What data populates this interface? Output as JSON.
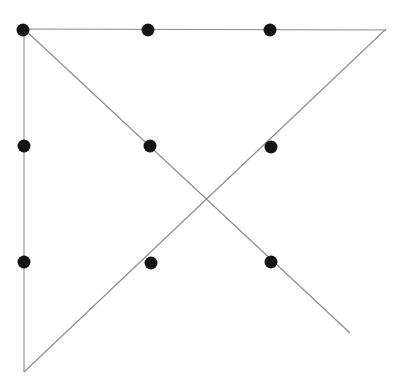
{
  "figure": {
    "canvas": {
      "width": 401,
      "height": 388,
      "background_color": "#ffffff"
    },
    "style": {
      "line_color": "#8a8a8a",
      "line_width": 1.1,
      "dot_color": "#141414",
      "dot_radius": 6.5
    },
    "lines": [
      {
        "name": "left-vertical-edge",
        "label": "Left vertical edge",
        "x1": 24.0,
        "y1": 29.0,
        "x2": 24.0,
        "y2": 372.0
      },
      {
        "name": "top-horizontal-edge",
        "label": "Top horizontal edge",
        "x1": 24.0,
        "y1": 29.0,
        "x2": 386.0,
        "y2": 30.0
      },
      {
        "name": "descending-diagonal",
        "label": "Diagonal from top-left to lower-right",
        "x1": 24.0,
        "y1": 29.0,
        "x2": 350.0,
        "y2": 333.0
      },
      {
        "name": "ascending-diagonal",
        "label": "Diagonal from bottom-left to top-right",
        "x1": 24.0,
        "y1": 372.0,
        "x2": 386.0,
        "y2": 29.0
      }
    ],
    "intersection": {
      "name": "diagonal-crossing-point",
      "label": "Crossing point of the two diagonals",
      "x": 200.0,
      "y": 198.0
    },
    "dots": [
      {
        "name": "dot-top-left",
        "label": "Top-left corner point",
        "x": 23.0,
        "y": 30.0,
        "row": 1,
        "col": 1
      },
      {
        "name": "dot-top-center",
        "label": "Top edge midpoint",
        "x": 148.0,
        "y": 30.0,
        "row": 1,
        "col": 2
      },
      {
        "name": "dot-top-right",
        "label": "Top edge right point",
        "x": 270.0,
        "y": 30.0,
        "row": 1,
        "col": 3
      },
      {
        "name": "dot-middle-left",
        "label": "Left edge middle point",
        "x": 24.0,
        "y": 146.0,
        "row": 2,
        "col": 1
      },
      {
        "name": "dot-middle-center",
        "label": "Center-left interior point",
        "x": 150.0,
        "y": 146.0,
        "row": 2,
        "col": 2
      },
      {
        "name": "dot-middle-right",
        "label": "Center-right interior point",
        "x": 271.0,
        "y": 147.0,
        "row": 2,
        "col": 3
      },
      {
        "name": "dot-bottom-left",
        "label": "Left edge lower point",
        "x": 24.0,
        "y": 262.0,
        "row": 3,
        "col": 1
      },
      {
        "name": "dot-bottom-center",
        "label": "Lower interior point",
        "x": 151.0,
        "y": 263.0,
        "row": 3,
        "col": 2
      },
      {
        "name": "dot-bottom-right",
        "label": "Lower-right point",
        "x": 271.0,
        "y": 262.0,
        "row": 3,
        "col": 3
      }
    ]
  }
}
